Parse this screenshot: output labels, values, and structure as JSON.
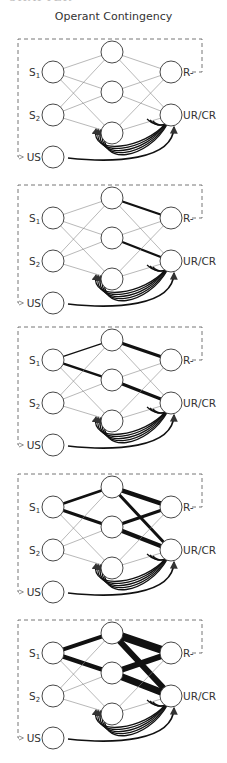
{
  "header": {
    "chapter_fragment": "CHAPTER"
  },
  "figure": {
    "title": "Operant Contingency",
    "colors": {
      "line": "#333333",
      "dash": "#666666",
      "node_fill": "#ffffff"
    }
  },
  "labels": {
    "s1": "S",
    "s1_sub": "1",
    "s2": "S",
    "s2_sub": "2",
    "us": "US",
    "r": "R-",
    "urcr": "UR/CR"
  },
  "layout": {
    "panel_offsets": [
      0,
      146,
      288,
      435,
      581
    ],
    "node_radius": 11,
    "nodes": {
      "S1": [
        53,
        72
      ],
      "S2": [
        53,
        115
      ],
      "US": [
        53,
        157
      ],
      "H1": [
        112,
        52
      ],
      "H2": [
        112,
        92
      ],
      "H3": [
        112,
        133
      ],
      "R": [
        171,
        72
      ],
      "UR": [
        171,
        115
      ]
    },
    "dash_box": {
      "left": 18,
      "top": 39,
      "right": 202
    }
  },
  "panels": [
    {
      "name": "panel-1-initial",
      "weights": {}
    },
    {
      "name": "panel-2",
      "weights": {
        "H1-R": 2.2,
        "H2-UR": 2.2
      }
    },
    {
      "name": "panel-3",
      "weights": {
        "S1-H1": 1.3,
        "S1-H2": 2.4,
        "H1-R": 3,
        "H2-UR": 3
      }
    },
    {
      "name": "panel-4",
      "weights": {
        "S1-H1": 2.6,
        "S1-H2": 3,
        "H1-R": 4.5,
        "H1-UR": 3,
        "H2-R": 3,
        "H2-UR": 4.5
      }
    },
    {
      "name": "panel-5",
      "weights": {
        "S1-H1": 4,
        "S1-H2": 4.5,
        "H1-R": 8,
        "H1-UR": 6,
        "H2-R": 6,
        "H2-UR": 7
      }
    }
  ]
}
